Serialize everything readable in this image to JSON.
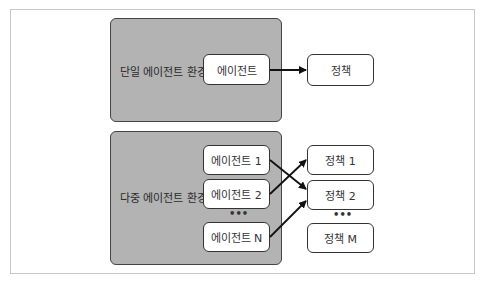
{
  "single_env": {
    "label": "단일 에이전트 환경",
    "agent": "에이전트",
    "policy": "정책"
  },
  "multi_env": {
    "label": "다중 에이전트 환경",
    "agents": [
      "에이전트 1",
      "에이전트 2",
      "에이전트 N"
    ],
    "policies": [
      "정책 1",
      "정책 2",
      "정책 M"
    ],
    "ellipsis": "•••"
  },
  "colors": {
    "env_fill": "#b3b3b3",
    "node_fill": "#ffffff",
    "stroke": "#333333"
  },
  "connections": [
    {
      "from": "에이전트",
      "to": "정책"
    },
    {
      "from": "에이전트 1",
      "to": "정책 2"
    },
    {
      "from": "에이전트 2",
      "to": "정책 1"
    },
    {
      "from": "에이전트 N",
      "to": "정책 2"
    }
  ]
}
